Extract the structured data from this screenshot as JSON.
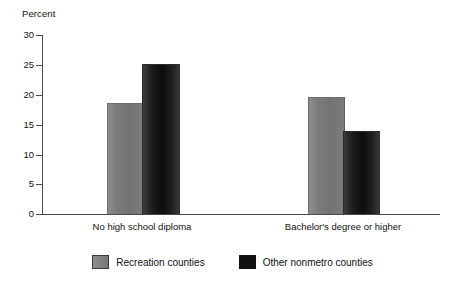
{
  "chart_data": {
    "type": "bar",
    "title": "",
    "ylabel": "Percent",
    "xlabel": "",
    "ylim": [
      0,
      30
    ],
    "yticks": [
      0,
      5,
      10,
      15,
      20,
      25,
      30
    ],
    "grid": false,
    "legend_position": "bottom",
    "categories": [
      "No high school diploma",
      "Bachelor's degree or higher"
    ],
    "series": [
      {
        "name": "Recreation counties",
        "color": "#7a7a7a",
        "values": [
          18.5,
          19.5
        ]
      },
      {
        "name": "Other nonmetro counties",
        "color": "#111111",
        "values": [
          25.0,
          13.7
        ]
      }
    ]
  },
  "axis": {
    "y_title": "Percent",
    "tick_labels": [
      "30",
      "25",
      "20",
      "15",
      "10",
      "5",
      "0"
    ]
  },
  "categories": [
    {
      "label": "No high school diploma"
    },
    {
      "label": "Bachelor's degree or higher"
    }
  ],
  "legend": {
    "items": [
      {
        "label": "Recreation counties",
        "swatch": "gray-swatch"
      },
      {
        "label": "Other nonmetro counties",
        "swatch": "black-swatch"
      }
    ]
  }
}
